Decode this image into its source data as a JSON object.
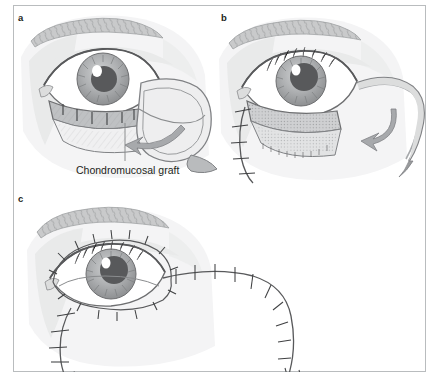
{
  "figure": {
    "kind": "surgical-illustration",
    "title_visible": false,
    "panel_count": 3,
    "background_color": "#ffffff",
    "frame_border_color": "#b9bcbe",
    "ink_color": "#231f20"
  },
  "palette": {
    "skin_light": "#f2f2f2",
    "skin_mid": "#e3e3e3",
    "skin_shadow": "#d2d3d4",
    "brow_fill": "#c9cacb",
    "brow_hair": "#8e9092",
    "sclera": "#ffffff",
    "iris_outer": "#9b9d9f",
    "iris_mid": "#b4b6b8",
    "pupil": "#58595b",
    "highlight": "#ffffff",
    "lid_margin": "#6d6e70",
    "graft_fill": "#d9dadb",
    "graft_hatch": "#939598",
    "flap_fill": "#e6e7e8",
    "outline": "#808285",
    "outline_dark": "#58595b",
    "suture_thread": "#6d6e70",
    "arrow_fill": "#a7a9ac"
  },
  "panels": [
    {
      "id": "a",
      "letter": "a",
      "caption_label": "Chondromucosal graft",
      "description": "Lower eyelid defect with chondromucosal graft placed posteriorly and a laterally based skin flap outlined; curved arrow shows flap rotation direction.",
      "annotations": [
        {
          "name": "chondromucosal-graft",
          "text": "Chondromucosal graft",
          "leader_line": true
        }
      ]
    },
    {
      "id": "b",
      "letter": "b",
      "caption_label": "",
      "description": "Flap elevated and transposed; graft bed shown with hatched surface, medial suture line closing the donor limb, curved arrow indicating rotation.",
      "annotations": []
    },
    {
      "id": "c",
      "letter": "c",
      "caption_label": "",
      "description": "Final closure showing continuous interrupted suture lines around the reconstructed lower eyelid and along the lateral and inferior incision limbs.",
      "annotations": []
    }
  ],
  "labels": {
    "panel_a_letter": "a",
    "panel_b_letter": "b",
    "panel_c_letter": "c",
    "graft_text": "Chondromucosal graft"
  }
}
